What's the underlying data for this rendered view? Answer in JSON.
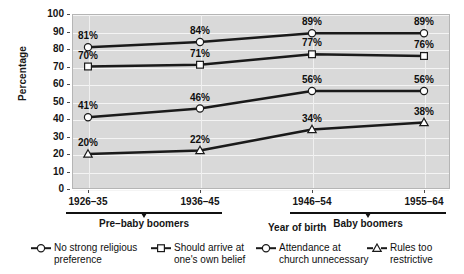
{
  "chart_data": {
    "type": "line",
    "title": "",
    "xlabel": "Year of birth",
    "ylabel": "Percentage",
    "ylim": [
      0,
      100
    ],
    "ytick_labels": [
      "100",
      "90",
      "80",
      "70",
      "60",
      "50",
      "40",
      "30",
      "20",
      "10",
      "0"
    ],
    "ytick_values": [
      100,
      90,
      80,
      70,
      60,
      50,
      40,
      30,
      20,
      10,
      0
    ],
    "grid": "horizontal-and-vertical-white",
    "legend_position": "below-axis",
    "categories": [
      "1926–35",
      "1936–45",
      "1946–54",
      "1955–64"
    ],
    "groups": [
      {
        "label": "Pre–baby boomers",
        "categories": [
          "1926–35",
          "1936–45"
        ]
      },
      {
        "label": "Baby boomers",
        "categories": [
          "1946–54",
          "1955–64"
        ]
      }
    ],
    "series": [
      {
        "name": "No strong religious preference",
        "marker": "circle",
        "values": [
          81,
          84,
          89,
          89
        ],
        "labels": [
          "81%",
          "84%",
          "89%",
          "89%"
        ]
      },
      {
        "name": "Should arrive at one's own belief",
        "marker": "square",
        "values": [
          70,
          71,
          77,
          76
        ],
        "labels": [
          "70%",
          "71%",
          "77%",
          "76%"
        ]
      },
      {
        "name": "Attendance at church unnecessary",
        "marker": "circle",
        "values": [
          41,
          46,
          56,
          56
        ],
        "labels": [
          "41%",
          "46%",
          "56%",
          "56%"
        ]
      },
      {
        "name": "Rules too restrictive",
        "marker": "triangle",
        "values": [
          20,
          22,
          34,
          38
        ],
        "labels": [
          "20%",
          "22%",
          "34%",
          "38%"
        ]
      }
    ]
  },
  "axis": {
    "y_title": "Percentage",
    "x_title": "Year of birth"
  },
  "legend": [
    {
      "marker": "circle",
      "line1": "No strong religious",
      "line2": "preference"
    },
    {
      "marker": "square",
      "line1": "Should arrive at",
      "line2": "one's own belief"
    },
    {
      "marker": "circle",
      "line1": "Attendance at",
      "line2": "church unnecessary"
    },
    {
      "marker": "triangle",
      "line1": "Rules too",
      "line2": "restrictive"
    }
  ],
  "colors": {
    "plot_background": "#d9d9d9",
    "gridline": "#f4f4f4",
    "line": "#1a1a1a",
    "text": "#141414",
    "page_background": "#ffffff"
  }
}
